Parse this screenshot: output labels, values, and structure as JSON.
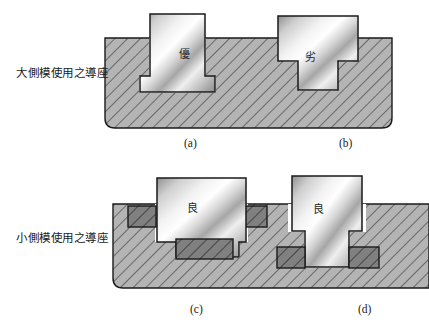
{
  "figure": {
    "background_color": "#ffffff",
    "rows": [
      {
        "id": "large-side-mold",
        "label": "大側模使用之導座",
        "blocks": [
          {
            "caption": "(a)",
            "mark": "優",
            "shape": "dovetail",
            "rating": "excellent"
          },
          {
            "caption": "(b)",
            "mark": "劣",
            "shape": "tee",
            "rating": "inferior"
          }
        ]
      },
      {
        "id": "small-side-mold",
        "label": "小側模使用之導座",
        "blocks": [
          {
            "caption": "(c)",
            "mark": "良",
            "shape": "dovetail-with-gibs",
            "rating": "good"
          },
          {
            "caption": "(d)",
            "mark": "良",
            "shape": "tee-with-gibs",
            "rating": "good"
          }
        ]
      }
    ]
  },
  "labels": {
    "top_row": "大側模使用之導座",
    "bottom_row": "小側模使用之導座"
  },
  "captions": {
    "a": "(a)",
    "b": "(b)",
    "c": "(c)",
    "d": "(d)"
  },
  "marks": {
    "a": "優",
    "b": "劣",
    "c": "良",
    "d": "良"
  },
  "colors": {
    "base_fill": "#b4b4b4",
    "hatch_line": "#2b2b2b",
    "gib_fill": "#7f7f7f",
    "outline": "#1a1a1a",
    "metal_light": "#fbfbfb",
    "metal_mid": "#c8c8c8",
    "metal_dark": "#9a9a9a",
    "text": "#1b1b1b"
  }
}
